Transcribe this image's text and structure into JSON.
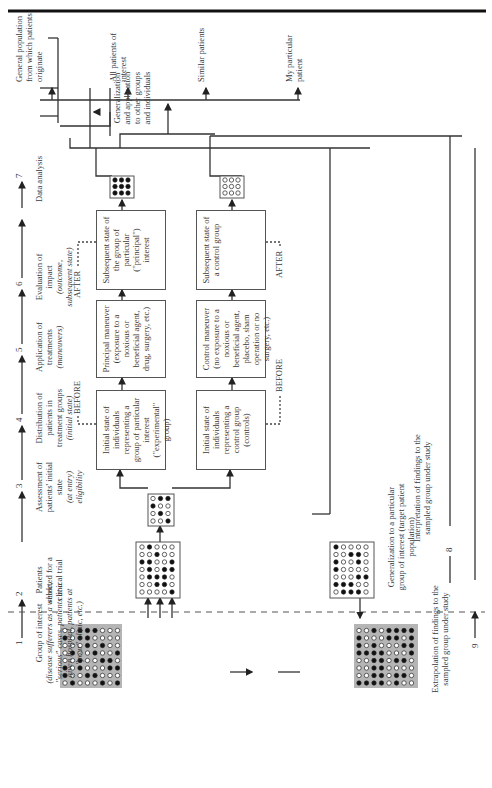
{
  "steps": [
    {
      "num": "1",
      "label": "Group of interest",
      "detail": "(disease sufferers as a whole, \"serious\" cases, patients at a given hospital, patients at \"your\" clinic, etc.)"
    },
    {
      "num": "2",
      "label": "Patients selected for a clinical trial",
      "detail": ""
    },
    {
      "num": "3",
      "label": "Assessment of patients' initial state",
      "detail": "(at entry) eligibility"
    },
    {
      "num": "4",
      "label": "Distribution of patients in treatment groups",
      "detail": "(initial state)"
    },
    {
      "num": "5",
      "label": "Application of treatments",
      "detail": "(maneuvers)"
    },
    {
      "num": "6",
      "label": "Evaluation of impact",
      "detail": "(outcome, subsequent state)"
    },
    {
      "num": "7",
      "label": "Data analysis",
      "detail": ""
    }
  ],
  "boxes": {
    "initial_experimental": "Initial state of individuals representing a group of particular interest (\"experimental\" group)",
    "principal_maneuver": "Principal maneuver (exposure to a noxious or beneficial agent, drug, surgery, etc.)",
    "subsequent_principal": "Subsequent state of the group of particular (\"principal\") interest",
    "initial_control": "Initial state of individuals representing a control group (controls)",
    "control_maneuver": "Control maneuver (no exposure to a noxious or beneficial agent, placebo, sham operation or no surgery, etc.)",
    "subsequent_control": "Subsequent state of a control group"
  },
  "markers": {
    "before_top": "BEFORE",
    "after_top": "AFTER",
    "before_bottom": "BEFORE",
    "after_bottom": "AFTER"
  },
  "generalization": {
    "label": "Generalization and application to other groups and individuals",
    "targets": [
      "General population from which patients originate",
      "All patients of interest",
      "Similar patients",
      "My particular patient"
    ]
  },
  "bottom": {
    "generalization_particular": "Generalization to a particular group of interest (target patient population)",
    "interpretation": "Interpretation of findings to the sampled group under study",
    "interpretation_num": "8",
    "extrapolation": "Extrapolation of findings to the sampled group under study",
    "extrapolation_num": "9"
  }
}
